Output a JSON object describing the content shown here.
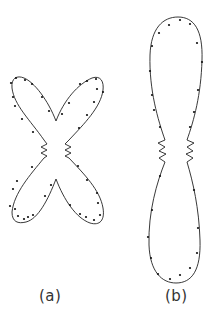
{
  "figure": {
    "panels": [
      {
        "id": "a",
        "label": "(a)",
        "shape": "four-lobed X-shaped polar pattern (butterfly) with measured data points",
        "lobes": [
          "upper-left",
          "upper-right",
          "lower-left",
          "lower-right"
        ]
      },
      {
        "id": "b",
        "label": "(b)",
        "shape": "two-lobed vertical figure-eight polar pattern with measured data points",
        "lobes": [
          "upper",
          "lower"
        ]
      }
    ],
    "colors": {
      "line": "#222222",
      "points": "#111111",
      "background": "#ffffff",
      "label": "#333333"
    }
  }
}
